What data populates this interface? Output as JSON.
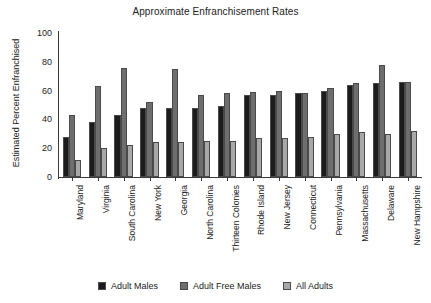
{
  "chart_data": {
    "type": "bar",
    "title": "Approximate Enfranchisement Rates",
    "xlabel": "",
    "ylabel": "Estimated Percent Enfranchised",
    "ylim": [
      0,
      100
    ],
    "yticks": [
      0,
      20,
      40,
      60,
      80,
      100
    ],
    "grid": false,
    "legend_position": "bottom",
    "categories": [
      "Maryland",
      "Virginia",
      "South Carolina",
      "New York",
      "Georgia",
      "North Carolina",
      "Thirteen Colonies",
      "Rhode Island",
      "New Jersey",
      "Connecticut",
      "Pennsylvania",
      "Massachusetts",
      "Delaware",
      "New Hampshire"
    ],
    "series": [
      {
        "name": "Adult Males",
        "color": "#1c1c1c",
        "values": [
          28,
          38,
          43,
          48,
          48,
          48,
          49,
          57,
          57,
          58,
          60,
          64,
          65,
          66
        ]
      },
      {
        "name": "Adult Free Males",
        "color": "#6e6e6e",
        "values": [
          43,
          63,
          76,
          52,
          75,
          57,
          58,
          59,
          60,
          58,
          62,
          65,
          78,
          66
        ]
      },
      {
        "name": "All Adults",
        "color": "#a8a8a8",
        "values": [
          12,
          20,
          22,
          24,
          24,
          25,
          25,
          27,
          27,
          28,
          30,
          31,
          30,
          32
        ]
      }
    ]
  }
}
